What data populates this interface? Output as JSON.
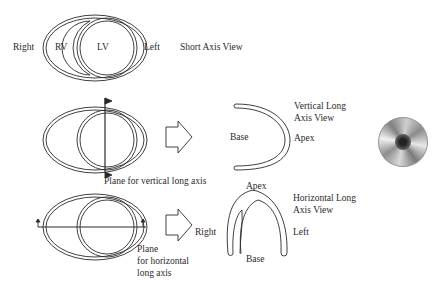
{
  "short_axis": {
    "right": "Right",
    "rv": "RV",
    "lv": "LV",
    "left": "Left",
    "title": "Short Axis View"
  },
  "vertical": {
    "plane_label": "Plane for vertical long axis",
    "base": "Base",
    "apex": "Apex",
    "title_line1": "Vertical Long",
    "title_line2": "Axis View"
  },
  "horizontal": {
    "plane_line1": "Plane",
    "plane_line2": "for horizontal",
    "plane_line3": "long axis",
    "right": "Right",
    "apex": "Apex",
    "left": "Left",
    "base": "Base",
    "title_line1": "Horizontal Long",
    "title_line2": "Axis View"
  },
  "colors": {
    "stroke": "#2a2a2a",
    "background": "#ffffff"
  }
}
